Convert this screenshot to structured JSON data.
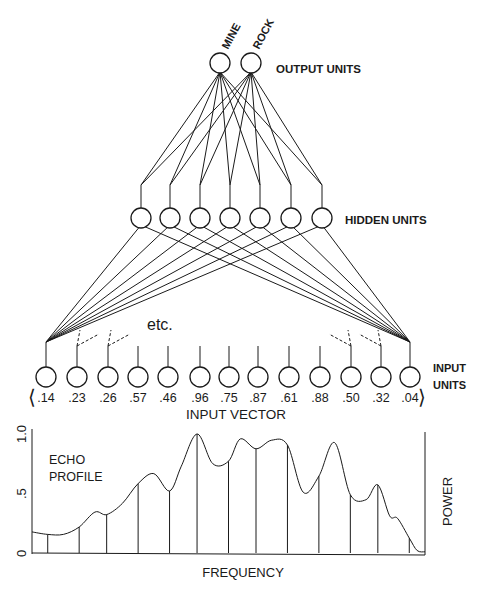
{
  "diagram": {
    "output_layer": {
      "label": "OUTPUT UNITS",
      "units": [
        {
          "name": "MINE",
          "x": 220,
          "y": 63
        },
        {
          "name": "ROCK",
          "x": 251,
          "y": 63
        }
      ]
    },
    "hidden_layer": {
      "label": "HIDDEN UNITS",
      "unit_x": [
        141,
        170,
        200,
        230,
        260,
        291,
        322
      ],
      "y": 218
    },
    "input_layer": {
      "label_line1": "INPUT",
      "label_line2": "UNITS",
      "unit_x": [
        46,
        77,
        108,
        138,
        168,
        200,
        229,
        258,
        289,
        320,
        351,
        381,
        410
      ],
      "y": 377,
      "values": [
        ".14",
        ".23",
        ".26",
        ".57",
        ".46",
        ".96",
        ".75",
        ".87",
        ".61",
        ".88",
        ".50",
        ".32",
        ".04"
      ],
      "vector_open": "⟨",
      "vector_close": "⟩",
      "vector_label": "INPUT VECTOR",
      "etc_label": "etc."
    }
  },
  "chart_data": {
    "type": "line",
    "title": "ECHO PROFILE",
    "title_line1": "ECHO",
    "title_line2": "PROFILE",
    "xlabel": "FREQUENCY",
    "ylabel": "POWER",
    "ylim": [
      0,
      1.0
    ],
    "yticks": [
      "0",
      ".5",
      "1.0"
    ],
    "grid": false,
    "sample_points_x_fraction": [
      0.04,
      0.12,
      0.19,
      0.27,
      0.35,
      0.42,
      0.5,
      0.57,
      0.65,
      0.73,
      0.81,
      0.88,
      0.96
    ],
    "sample_values": [
      0.14,
      0.23,
      0.26,
      0.57,
      0.46,
      0.96,
      0.75,
      0.87,
      0.61,
      0.88,
      0.5,
      0.32,
      0.04
    ],
    "curve_x": [
      0.0,
      0.04,
      0.08,
      0.12,
      0.16,
      0.19,
      0.23,
      0.27,
      0.31,
      0.35,
      0.38,
      0.42,
      0.46,
      0.5,
      0.53,
      0.57,
      0.61,
      0.65,
      0.69,
      0.73,
      0.77,
      0.81,
      0.85,
      0.88,
      0.91,
      0.93,
      0.96,
      0.98,
      1.0
    ],
    "curve_y": [
      0.17,
      0.15,
      0.15,
      0.21,
      0.33,
      0.31,
      0.4,
      0.56,
      0.64,
      0.5,
      0.7,
      0.96,
      0.72,
      0.74,
      0.92,
      0.84,
      0.91,
      0.87,
      0.49,
      0.62,
      0.89,
      0.47,
      0.43,
      0.55,
      0.3,
      0.28,
      0.12,
      0.02,
      0.01
    ]
  }
}
